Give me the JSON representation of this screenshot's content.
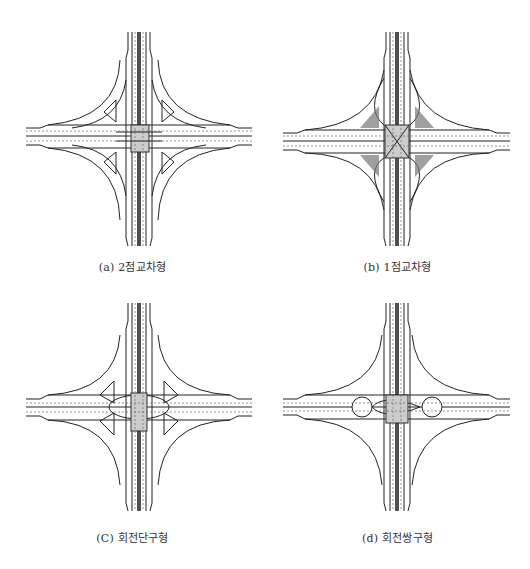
{
  "figure": {
    "panels": [
      {
        "id": "a",
        "caption": "(a) 2점교차형",
        "type": "two-point-crossing"
      },
      {
        "id": "b",
        "caption": "(b) 1점교차형",
        "type": "single-point-crossing"
      },
      {
        "id": "c",
        "caption": "(C) 회전단구형",
        "type": "single-roundabout"
      },
      {
        "id": "d",
        "caption": "(d) 회전쌍구형",
        "type": "twin-roundabout"
      }
    ]
  },
  "colors": {
    "line": "#222222",
    "lane_mark": "#555555",
    "hatch": "#666666",
    "bridge_fill": "#bdbdbd"
  }
}
